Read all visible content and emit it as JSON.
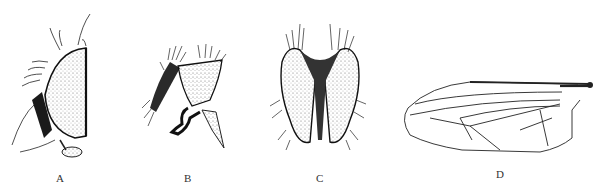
{
  "figure": {
    "panels": [
      {
        "id": "A",
        "label": "A",
        "subject": "head-lateral-view"
      },
      {
        "id": "B",
        "label": "B",
        "subject": "genitalia-lateral-view"
      },
      {
        "id": "C",
        "label": "C",
        "subject": "genitalia-dorsal-view"
      },
      {
        "id": "D",
        "label": "D",
        "subject": "wing"
      }
    ]
  }
}
